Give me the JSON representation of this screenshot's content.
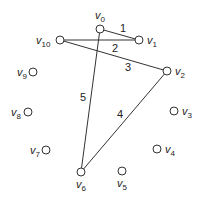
{
  "diagram": {
    "type": "graph",
    "vertex_prefix": "v",
    "vertices": [
      {
        "id": "0",
        "x": 100,
        "y": 29,
        "lx": 95,
        "ly": 19
      },
      {
        "id": "1",
        "x": 139,
        "y": 40,
        "lx": 147,
        "ly": 44
      },
      {
        "id": "2",
        "x": 167,
        "y": 71,
        "lx": 175,
        "ly": 75
      },
      {
        "id": "3",
        "x": 174,
        "y": 111,
        "lx": 182,
        "ly": 115
      },
      {
        "id": "4",
        "x": 157,
        "y": 149,
        "lx": 165,
        "ly": 153
      },
      {
        "id": "5",
        "x": 122,
        "y": 171,
        "lx": 117,
        "ly": 187
      },
      {
        "id": "6",
        "x": 81,
        "y": 172,
        "lx": 76,
        "ly": 188
      },
      {
        "id": "7",
        "x": 46,
        "y": 150,
        "lx": 30,
        "ly": 154
      },
      {
        "id": "8",
        "x": 28,
        "y": 112,
        "lx": 11,
        "ly": 116
      },
      {
        "id": "9",
        "x": 33,
        "y": 72,
        "lx": 17,
        "ly": 76
      },
      {
        "id": "10",
        "x": 60,
        "y": 40,
        "lx": 36,
        "ly": 44
      }
    ],
    "edges": [
      {
        "from": "0",
        "to": "1",
        "label": "1",
        "lx": 120,
        "ly": 32
      },
      {
        "from": "10",
        "to": "1",
        "label": "2",
        "lx": 112,
        "ly": 52
      },
      {
        "from": "10",
        "to": "2",
        "label": "3",
        "lx": 125,
        "ly": 71
      },
      {
        "from": "2",
        "to": "6",
        "label": "4",
        "lx": 117,
        "ly": 118
      },
      {
        "from": "0",
        "to": "6",
        "label": "5",
        "lx": 80,
        "ly": 101
      }
    ]
  }
}
